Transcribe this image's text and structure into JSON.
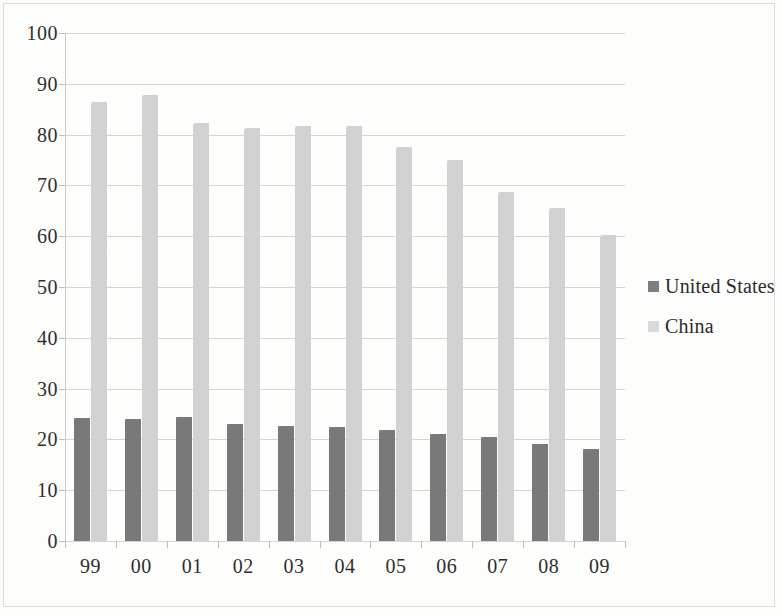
{
  "chart_data": {
    "type": "bar",
    "title": "",
    "subtitle": "",
    "xlabel": "",
    "ylabel": "",
    "ylim": [
      0,
      100
    ],
    "ytick_step": 10,
    "yticks": [
      "100",
      "90",
      "80",
      "70",
      "60",
      "50",
      "40",
      "30",
      "20",
      "10",
      "0"
    ],
    "grid": true,
    "legend_position": "right",
    "categories": [
      "99",
      "00",
      "01",
      "02",
      "03",
      "04",
      "05",
      "06",
      "07",
      "08",
      "09"
    ],
    "series": [
      {
        "name": "United States",
        "color": "#7f7f7f",
        "values": [
          24.3,
          24.0,
          24.5,
          23.1,
          22.6,
          22.4,
          21.8,
          21.0,
          20.4,
          19.2,
          18.2
        ]
      },
      {
        "name": "China",
        "color": "#d9d9d9",
        "values": [
          86.5,
          87.8,
          82.2,
          81.3,
          81.8,
          81.8,
          77.6,
          75.0,
          68.8,
          65.6,
          60.2
        ]
      }
    ]
  },
  "legend": {
    "items": [
      {
        "label": "United States",
        "swatch": "us"
      },
      {
        "label": "China",
        "swatch": "cn"
      }
    ]
  },
  "colors": {
    "series_united_states": "#7f7f7f",
    "series_china": "#d9d9d9",
    "gridline": "#d4d4d0",
    "axis": "#bdbdb9",
    "text": "#2e2e2e",
    "background": "#fdfdfc"
  }
}
